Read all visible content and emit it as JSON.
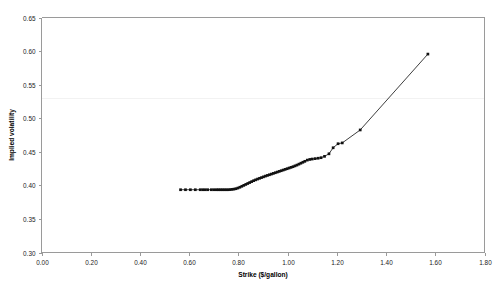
{
  "chart_data": {
    "type": "line",
    "title": "",
    "xlabel": "Strike ($/gallon)",
    "ylabel": "Implied volatility",
    "xlim": [
      0.0,
      1.8
    ],
    "ylim": [
      0.3,
      0.65
    ],
    "xticks": [
      "0.00",
      "0.20",
      "0.40",
      "0.60",
      "0.80",
      "1.00",
      "1.20",
      "1.40",
      "1.60",
      "1.80"
    ],
    "xtick_values": [
      0.0,
      0.2,
      0.4,
      0.6,
      0.8,
      1.0,
      1.2,
      1.4,
      1.6,
      1.8
    ],
    "yticks": [
      "0.30",
      "0.35",
      "0.40",
      "0.45",
      "0.50",
      "0.55",
      "0.60",
      "0.65"
    ],
    "ytick_values": [
      0.3,
      0.35,
      0.4,
      0.45,
      0.5,
      0.55,
      0.6,
      0.65
    ],
    "grid": false,
    "legend": null,
    "marker": "filled-square",
    "line_color": "#1b1b1b",
    "marker_color": "#111111",
    "axis_color": "#9a9a9a",
    "background": "#ffffff",
    "series": [
      {
        "name": "Implied volatility smile",
        "x": [
          0.565,
          0.585,
          0.605,
          0.625,
          0.645,
          0.655,
          0.665,
          0.675,
          0.69,
          0.7,
          0.71,
          0.718,
          0.726,
          0.734,
          0.742,
          0.75,
          0.758,
          0.766,
          0.774,
          0.782,
          0.79,
          0.798,
          0.806,
          0.814,
          0.822,
          0.83,
          0.838,
          0.846,
          0.854,
          0.862,
          0.87,
          0.878,
          0.886,
          0.894,
          0.902,
          0.91,
          0.918,
          0.926,
          0.934,
          0.942,
          0.95,
          0.958,
          0.966,
          0.974,
          0.982,
          0.99,
          0.998,
          1.006,
          1.014,
          1.022,
          1.03,
          1.038,
          1.046,
          1.054,
          1.062,
          1.07,
          1.08,
          1.09,
          1.1,
          1.112,
          1.124,
          1.136,
          1.15,
          1.168,
          1.185,
          1.205,
          1.222,
          1.295,
          1.57
        ],
        "y": [
          0.3935,
          0.3935,
          0.3935,
          0.3935,
          0.3935,
          0.3935,
          0.3935,
          0.3935,
          0.3935,
          0.3935,
          0.3935,
          0.3935,
          0.3935,
          0.3935,
          0.3935,
          0.3935,
          0.3935,
          0.3937,
          0.394,
          0.3944,
          0.395,
          0.396,
          0.3972,
          0.3986,
          0.4,
          0.4014,
          0.4028,
          0.4042,
          0.4056,
          0.407,
          0.4082,
          0.4094,
          0.4105,
          0.4116,
          0.4127,
          0.4138,
          0.4148,
          0.4158,
          0.4168,
          0.4178,
          0.4188,
          0.4198,
          0.4208,
          0.4218,
          0.4228,
          0.4238,
          0.4248,
          0.4258,
          0.4268,
          0.4278,
          0.429,
          0.4302,
          0.4316,
          0.433,
          0.4344,
          0.4358,
          0.4376,
          0.4386,
          0.4392,
          0.4398,
          0.4404,
          0.4412,
          0.4432,
          0.447,
          0.456,
          0.462,
          0.4632,
          0.4825,
          0.5955
        ]
      }
    ],
    "annotations": [
      {
        "name": "flat-region",
        "x_start": 0.565,
        "x_end": 0.8,
        "value": 0.3935
      },
      {
        "name": "kink-point",
        "x": 0.83,
        "value": 0.4014
      },
      {
        "name": "max-point",
        "x": 1.57,
        "value": 0.5955
      },
      {
        "name": "min-point",
        "x": 0.565,
        "value": 0.3935
      }
    ],
    "faint_artifact_line": {
      "y_value": 0.53,
      "color": "#f2f2f2"
    }
  }
}
